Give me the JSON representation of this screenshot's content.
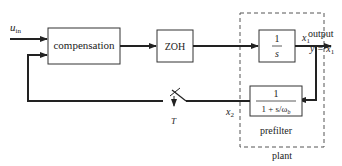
{
  "diagram": {
    "input_label": "u",
    "input_subscript": "in",
    "blocks": {
      "compensation": "compensation",
      "zoh": "ZOH",
      "integrator_num": "1",
      "integrator_den": "s",
      "prefilter_num": "1",
      "prefilter_den": "1 + s/ω",
      "prefilter_den_sub": "b"
    },
    "signals": {
      "x1": "x",
      "x1_sub": "1",
      "x2": "x",
      "x2_sub": "2",
      "output_label": "output",
      "output_eq": "y = x",
      "output_eq_sub": "1",
      "sampler": "T"
    },
    "groups": {
      "prefilter": "prefilter",
      "plant": "plant"
    }
  }
}
